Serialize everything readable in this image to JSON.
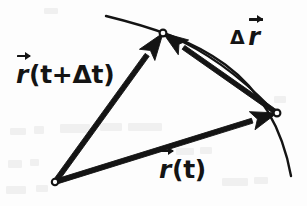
{
  "figure": {
    "kind": "vector-displacement-diagram",
    "background_color": "#fdfdfd",
    "ink_color": "#141414",
    "labels": {
      "position_vector_later": {
        "symbol": "r",
        "argument": "(t+Δt)",
        "full_text": "r⃗(t+Δt)"
      },
      "position_vector_initial": {
        "symbol": "r",
        "argument": "(t)",
        "full_text": "r⃗(t)"
      },
      "displacement_vector": {
        "delta": "Δ",
        "symbol": "r",
        "full_text": "Δ r⃗"
      }
    },
    "geometry": {
      "origin_point": {
        "x": 55,
        "y": 182,
        "radius": 3.2
      },
      "point_at_t": {
        "x": 277,
        "y": 113,
        "radius": 3.4
      },
      "point_at_t_plus_dt": {
        "x": 163,
        "y": 33,
        "radius": 3.4
      },
      "trajectory_curve": {
        "start": {
          "x": 106,
          "y": 16
        },
        "control_1": {
          "x": 196,
          "y": 38
        },
        "control_2": {
          "x": 272,
          "y": 70
        },
        "end": {
          "x": 291,
          "y": 176
        }
      },
      "arc_path_segment": {
        "start": {
          "x": 271,
          "y": 108
        },
        "control": {
          "x": 222,
          "y": 58
        },
        "end": {
          "x": 170,
          "y": 36
        }
      },
      "vectors": [
        {
          "name": "r-t",
          "from": {
            "x": 55,
            "y": 182
          },
          "to": {
            "x": 277,
            "y": 113
          },
          "shaft_width": 5.0,
          "head_length": 26,
          "head_half_width": 9.5
        },
        {
          "name": "r-t-plus-dt",
          "from": {
            "x": 55,
            "y": 182
          },
          "to": {
            "x": 163,
            "y": 33
          },
          "shaft_width": 5.0,
          "head_length": 27,
          "head_half_width": 9.5
        },
        {
          "name": "delta-r",
          "from": {
            "x": 277,
            "y": 113
          },
          "to": {
            "x": 163,
            "y": 33
          },
          "shaft_width": 4.6,
          "head_length": 25,
          "head_half_width": 9.0
        }
      ]
    },
    "ghost_marks": [
      {
        "x": 10,
        "y": 128,
        "w": 16,
        "h": 7
      },
      {
        "x": 34,
        "y": 126,
        "w": 10,
        "h": 8
      },
      {
        "x": 60,
        "y": 124,
        "w": 30,
        "h": 9
      },
      {
        "x": 100,
        "y": 123,
        "w": 22,
        "h": 8
      },
      {
        "x": 128,
        "y": 123,
        "w": 34,
        "h": 8
      },
      {
        "x": 8,
        "y": 160,
        "w": 14,
        "h": 8
      },
      {
        "x": 30,
        "y": 159,
        "w": 9,
        "h": 7
      },
      {
        "x": 176,
        "y": 148,
        "w": 18,
        "h": 7
      },
      {
        "x": 200,
        "y": 147,
        "w": 12,
        "h": 7
      },
      {
        "x": 6,
        "y": 186,
        "w": 20,
        "h": 8
      },
      {
        "x": 36,
        "y": 185,
        "w": 12,
        "h": 7
      },
      {
        "x": 222,
        "y": 178,
        "w": 26,
        "h": 8
      },
      {
        "x": 254,
        "y": 177,
        "w": 14,
        "h": 7
      },
      {
        "x": 274,
        "y": 96,
        "w": 12,
        "h": 7
      },
      {
        "x": 44,
        "y": 8,
        "w": 14,
        "h": 6
      }
    ]
  }
}
